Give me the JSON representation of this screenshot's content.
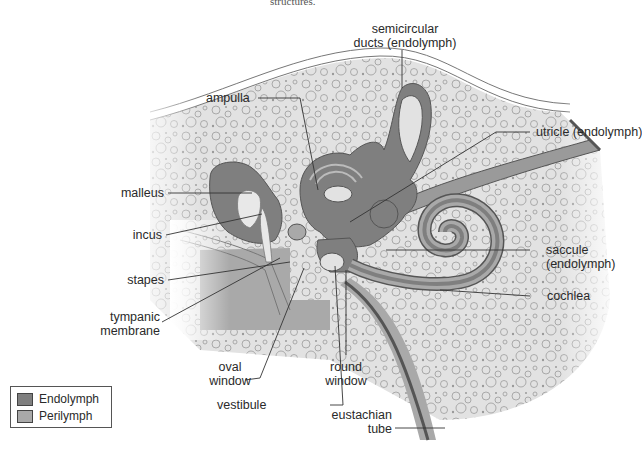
{
  "caption_fragment": "structures.",
  "colors": {
    "endolymph": "#7f7f7f",
    "perilymph": "#a9a9a9",
    "bone": "#e2e2e2",
    "outline": "#555555"
  },
  "labels": {
    "semicircular_ducts": [
      "semicircular",
      "ducts (endolymph)"
    ],
    "ampulla": "ampulla",
    "utricle": "utricle (endolymph)",
    "malleus": "malleus",
    "incus": "incus",
    "saccule": [
      "saccule",
      "(endolymph)"
    ],
    "stapes": "stapes",
    "cochlea": "cochlea",
    "tympanic_membrane": [
      "tympanic",
      "membrane"
    ],
    "oval_window": [
      "oval",
      "window"
    ],
    "round_window": [
      "round",
      "window"
    ],
    "vestibule": "vestibule",
    "eustachian_tube": [
      "eustachian",
      "tube"
    ]
  },
  "legend": {
    "items": [
      {
        "label": "Endolymph",
        "color": "#7f7f7f"
      },
      {
        "label": "Perilymph",
        "color": "#a9a9a9"
      }
    ]
  }
}
